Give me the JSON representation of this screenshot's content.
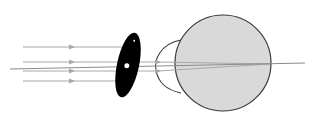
{
  "diagram": {
    "colors": {
      "background": "#ffffff",
      "ray": "#a8a8a8",
      "axis": "#8a8a8a",
      "occluder": "#000000",
      "eyeball_fill": "#d9d9d9",
      "eyeball_stroke": "#3a3a3a"
    },
    "elements": {
      "incoming_rays": [
        {
          "y_start": 47,
          "y_end": 47
        },
        {
          "y_start": 62,
          "y_end": 62
        },
        {
          "y_start": 71,
          "y_end": 71
        },
        {
          "y_start": 81,
          "y_end": 81
        }
      ],
      "optical_axis": {
        "x1": 10,
        "y1": 69,
        "x2": 305,
        "y2": 63
      },
      "occluder": {
        "cx": 128,
        "cy": 65,
        "rx": 11,
        "ry": 33,
        "pinhole_r": 2.5
      },
      "cornea": {
        "label": "cornea"
      },
      "eyeball": {
        "cx": 223,
        "cy": 63,
        "r": 48
      }
    }
  }
}
